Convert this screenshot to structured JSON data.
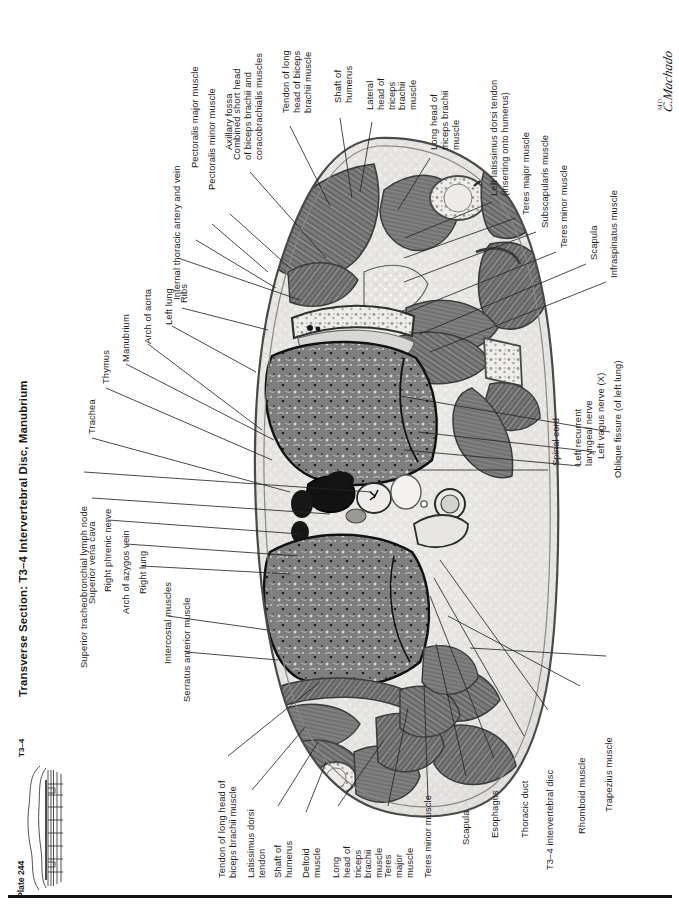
{
  "header": {
    "title": "Transverse Section: T3–4 Intervertebral Disc, Manubrium",
    "signature": "C.Machado",
    "signature_suffix": "M.D."
  },
  "plate": {
    "number_label": "Plate 244",
    "level_label": "T3–4",
    "schematic_name": "vertebral-level-schematic"
  },
  "figure": {
    "name": "transverse-thoracic-section",
    "palette": {
      "muscle_dark": "#6e6e6e",
      "muscle_mid": "#8a8a8a",
      "lung": "#7d7d7d",
      "fat_light": "#e3e1dd",
      "skin_outline": "#3a3a3a",
      "vessel_lumen": "#141414",
      "bone_light": "#f2f0ec",
      "leader_line": "#2b2b2b",
      "page_bg": "#ffffff"
    }
  },
  "labels_top_left": [
    {
      "text": "Internal thoracic artery and vein"
    },
    {
      "text": "Pectoralis major muscle"
    },
    {
      "text": "Pectoralis minor muscle"
    },
    {
      "text": "Axillary fossa"
    },
    {
      "text": "Combined short head\nof biceps brachii and\ncoracobrachialis muscles"
    },
    {
      "text": "Tendon of long\nhead of biceps\nbrachii muscle"
    },
    {
      "text": "Shaft of\nhumerus"
    },
    {
      "text": "Lateral\nhead of\ntriceps\nbrachii\nmuscle"
    },
    {
      "text": "Long head of\ntriceps brachii\nmuscle"
    }
  ],
  "labels_right": [
    {
      "text": "Left latissimus dorsi tendon\n(inserting onto humerus)"
    },
    {
      "text": "Teres major muscle"
    },
    {
      "text": "Subscapularis muscle"
    },
    {
      "text": "Teres minor muscle"
    },
    {
      "text": "Scapula"
    },
    {
      "text": "Infraspinatus muscle"
    },
    {
      "text": "Oblique fissure (of left lung)"
    },
    {
      "text": "Left vagus nerve (X)"
    },
    {
      "text": "Left recurrent\nlaryngeal nerve"
    },
    {
      "text": "Spinal cord"
    }
  ],
  "labels_left": [
    {
      "text": "Ribs"
    },
    {
      "text": "Left lung"
    },
    {
      "text": "Arch of aorta"
    },
    {
      "text": "Manubrium"
    },
    {
      "text": "Thymus"
    },
    {
      "text": "Trachea"
    },
    {
      "text": "Superior tracheobronchial lymph node"
    },
    {
      "text": "Superior vena cava"
    },
    {
      "text": "Right phrenic nerve"
    },
    {
      "text": "Arch of azygos vein"
    },
    {
      "text": "Right lung"
    },
    {
      "text": "Intercostal muscles"
    },
    {
      "text": "Serratus anterior muscle"
    }
  ],
  "labels_bottom": [
    {
      "text": "Tendon of long head of\nbiceps brachii muscle"
    },
    {
      "text": "Latissimus dorsi\ntendon"
    },
    {
      "text": "Shaft of\nhumerus"
    },
    {
      "text": "Deltoid\nmuscle"
    },
    {
      "text": "Long\nhead of\ntriceps\nbrachii\nmuscle"
    },
    {
      "text": "Teres\nmajor\nmuscle"
    },
    {
      "text": "Teres minor muscle"
    },
    {
      "text": "Scapula"
    },
    {
      "text": "Esophagus"
    },
    {
      "text": "Thoracic duct"
    },
    {
      "text": "T3–4 intervertebral disc"
    },
    {
      "text": "Rhomboid muscle"
    },
    {
      "text": "Trapezius muscle"
    }
  ]
}
